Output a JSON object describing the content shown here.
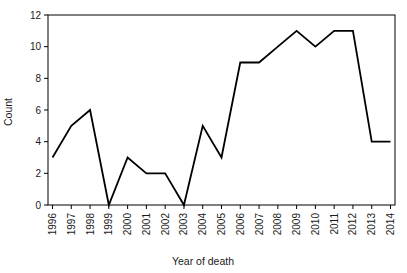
{
  "chart_data": {
    "type": "line",
    "title": "",
    "xlabel": "Year of death",
    "ylabel": "Count",
    "categories": [
      "1996",
      "1997",
      "1998",
      "1999",
      "2000",
      "2001",
      "2002",
      "2003",
      "2004",
      "2005",
      "2006",
      "2007",
      "2008",
      "2009",
      "2010",
      "2011",
      "2012",
      "2013",
      "2014"
    ],
    "values": [
      3,
      5,
      6,
      0,
      3,
      2,
      2,
      0,
      5,
      3,
      9,
      9,
      10,
      11,
      10,
      11,
      11,
      4,
      4
    ],
    "series": [
      {
        "name": "Count",
        "values": [
          3,
          5,
          6,
          0,
          3,
          2,
          2,
          0,
          5,
          3,
          9,
          9,
          10,
          11,
          10,
          11,
          11,
          4,
          4
        ]
      }
    ],
    "ylim": [
      0,
      12
    ],
    "yticks": [
      0,
      2,
      4,
      6,
      8,
      10,
      12
    ],
    "yticklabels": [
      "0",
      "2",
      "4",
      "6",
      "8",
      "10",
      "12"
    ],
    "xticklabels": [
      "1996",
      "1997",
      "1998",
      "1999",
      "2000",
      "2001",
      "2002",
      "2003",
      "2004",
      "2005",
      "2006",
      "2007",
      "2008",
      "2009",
      "2010",
      "2011",
      "2012",
      "2013",
      "2014"
    ],
    "xtick_rotation": 90,
    "grid": false,
    "legend": false,
    "legend_position": "none",
    "line_color": "#000000",
    "line_width": 1.8,
    "markers": "none",
    "background_color": "#ffffff",
    "frame_color": "#000000",
    "annotations": []
  }
}
